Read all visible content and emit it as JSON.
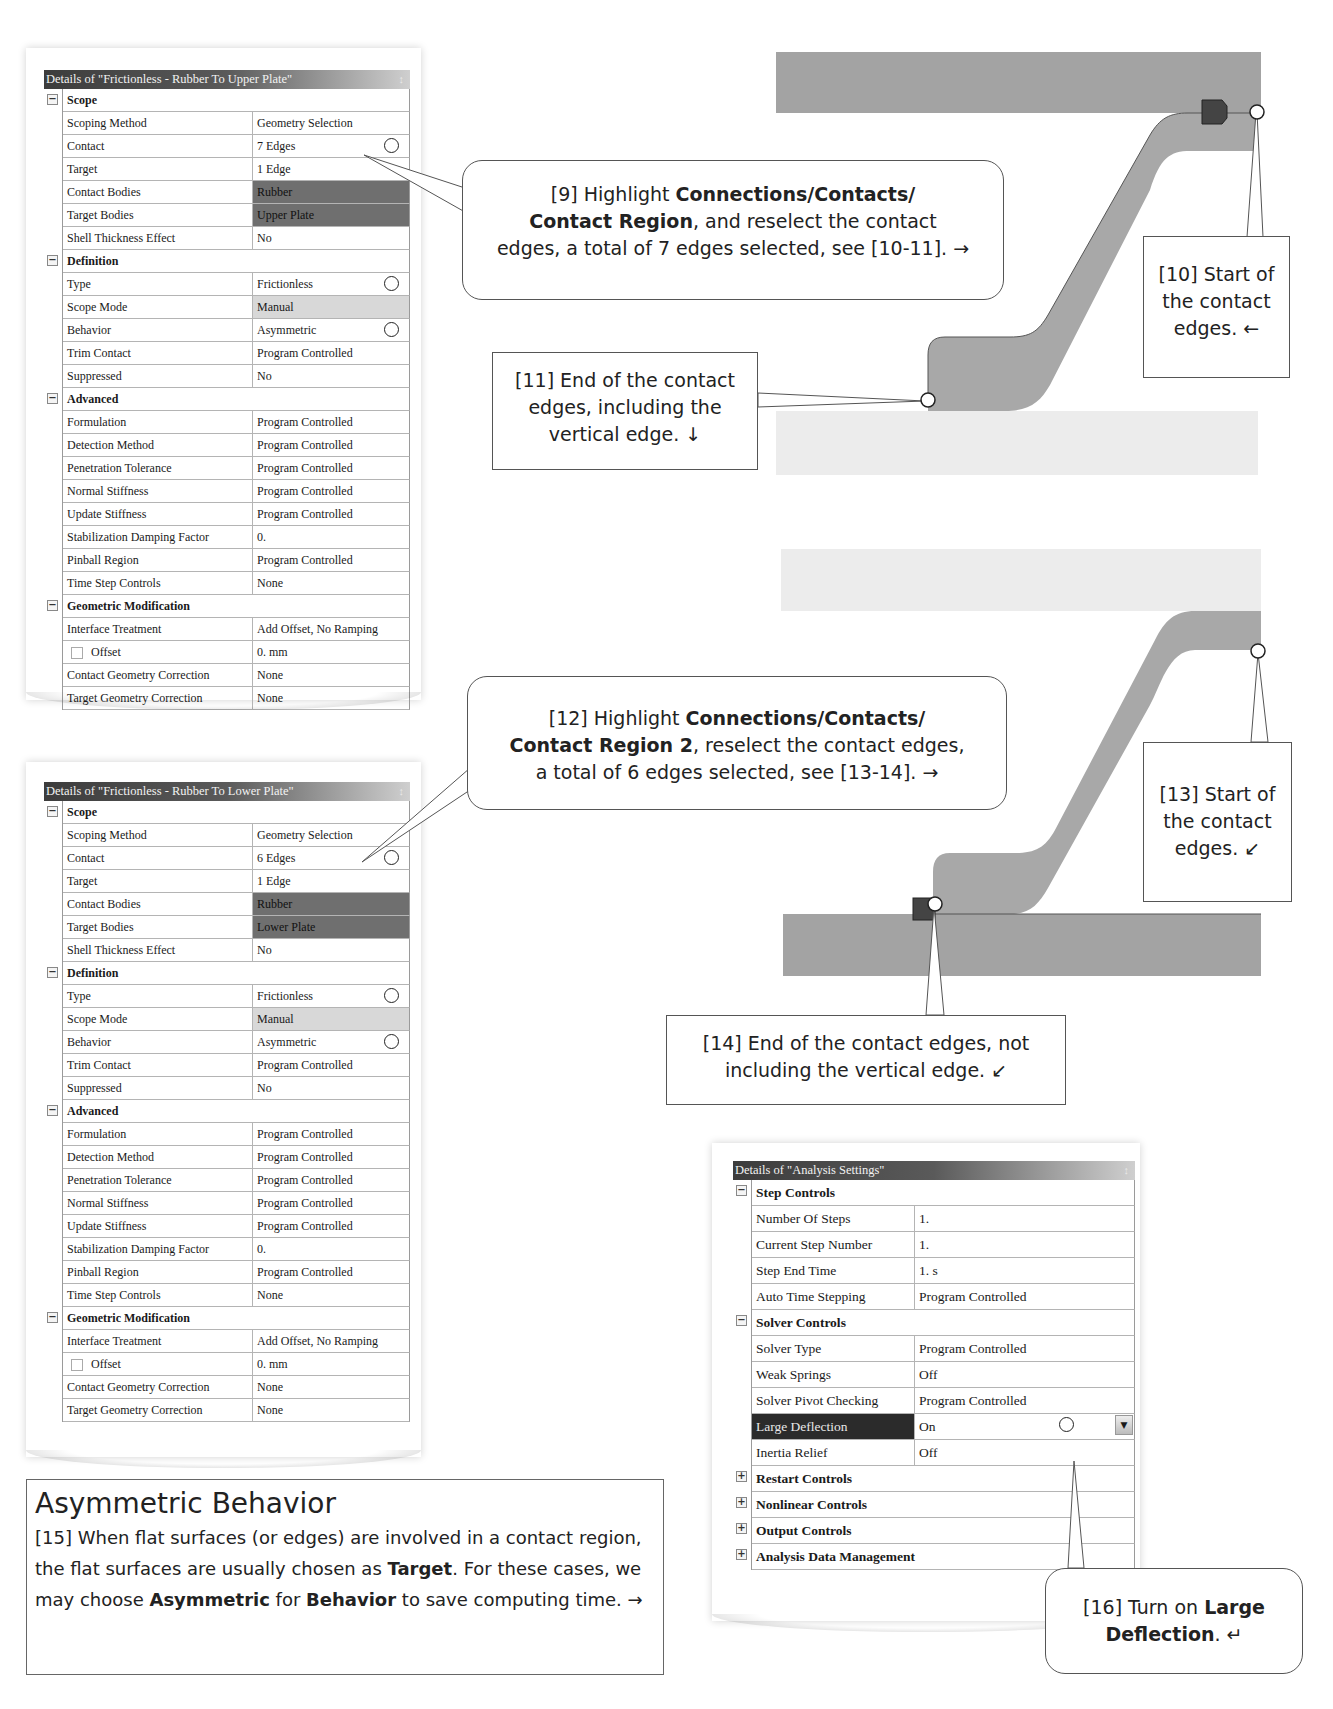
{
  "panel_upper": {
    "title": "Details of \"Frictionless - Rubber To Upper Plate\"",
    "pin_icon": "pin-icon",
    "groups": [
      {
        "label": "Scope",
        "rows": [
          {
            "k": "Scoping Method",
            "v": "Geometry Selection"
          },
          {
            "k": "Contact",
            "v": "7 Edges"
          },
          {
            "k": "Target",
            "v": "1 Edge"
          },
          {
            "k": "Contact Bodies",
            "v": "Rubber"
          },
          {
            "k": "Target Bodies",
            "v": "Upper Plate"
          },
          {
            "k": "Shell Thickness Effect",
            "v": "No"
          }
        ]
      },
      {
        "label": "Definition",
        "rows": [
          {
            "k": "Type",
            "v": "Frictionless"
          },
          {
            "k": "Scope Mode",
            "v": "Manual"
          },
          {
            "k": "Behavior",
            "v": "Asymmetric"
          },
          {
            "k": "Trim Contact",
            "v": "Program Controlled"
          },
          {
            "k": "Suppressed",
            "v": "No"
          }
        ]
      },
      {
        "label": "Advanced",
        "rows": [
          {
            "k": "Formulation",
            "v": "Program Controlled"
          },
          {
            "k": "Detection Method",
            "v": "Program Controlled"
          },
          {
            "k": "Penetration Tolerance",
            "v": "Program Controlled"
          },
          {
            "k": "Normal Stiffness",
            "v": "Program Controlled"
          },
          {
            "k": "Update Stiffness",
            "v": "Program Controlled"
          },
          {
            "k": "Stabilization Damping Factor",
            "v": "0."
          },
          {
            "k": "Pinball Region",
            "v": "Program Controlled"
          },
          {
            "k": "Time Step Controls",
            "v": "None"
          }
        ]
      },
      {
        "label": "Geometric Modification",
        "rows": [
          {
            "k": "Interface Treatment",
            "v": "Add Offset, No Ramping"
          },
          {
            "k": "Offset",
            "v": "0. mm"
          },
          {
            "k": "Contact Geometry Correction",
            "v": "None"
          },
          {
            "k": "Target Geometry Correction",
            "v": "None"
          }
        ]
      }
    ]
  },
  "panel_lower": {
    "title": "Details of \"Frictionless - Rubber To Lower Plate\"",
    "pin_icon": "pin-icon",
    "groups": [
      {
        "label": "Scope",
        "rows": [
          {
            "k": "Scoping Method",
            "v": "Geometry Selection"
          },
          {
            "k": "Contact",
            "v": "6 Edges"
          },
          {
            "k": "Target",
            "v": "1 Edge"
          },
          {
            "k": "Contact Bodies",
            "v": "Rubber"
          },
          {
            "k": "Target Bodies",
            "v": "Lower Plate"
          },
          {
            "k": "Shell Thickness Effect",
            "v": "No"
          }
        ]
      },
      {
        "label": "Definition",
        "rows": [
          {
            "k": "Type",
            "v": "Frictionless"
          },
          {
            "k": "Scope Mode",
            "v": "Manual"
          },
          {
            "k": "Behavior",
            "v": "Asymmetric"
          },
          {
            "k": "Trim Contact",
            "v": "Program Controlled"
          },
          {
            "k": "Suppressed",
            "v": "No"
          }
        ]
      },
      {
        "label": "Advanced",
        "rows": [
          {
            "k": "Formulation",
            "v": "Program Controlled"
          },
          {
            "k": "Detection Method",
            "v": "Program Controlled"
          },
          {
            "k": "Penetration Tolerance",
            "v": "Program Controlled"
          },
          {
            "k": "Normal Stiffness",
            "v": "Program Controlled"
          },
          {
            "k": "Update Stiffness",
            "v": "Program Controlled"
          },
          {
            "k": "Stabilization Damping Factor",
            "v": "0."
          },
          {
            "k": "Pinball Region",
            "v": "Program Controlled"
          },
          {
            "k": "Time Step Controls",
            "v": "None"
          }
        ]
      },
      {
        "label": "Geometric Modification",
        "rows": [
          {
            "k": "Interface Treatment",
            "v": "Add Offset, No Ramping"
          },
          {
            "k": "Offset",
            "v": "0. mm"
          },
          {
            "k": "Contact Geometry Correction",
            "v": "None"
          },
          {
            "k": "Target Geometry Correction",
            "v": "None"
          }
        ]
      }
    ]
  },
  "panel_analysis": {
    "title": "Details of \"Analysis Settings\"",
    "pin_icon": "pin-icon",
    "groups": [
      {
        "label": "Step Controls",
        "expanded": true,
        "rows": [
          {
            "k": "Number Of Steps",
            "v": "1."
          },
          {
            "k": "Current Step Number",
            "v": "1."
          },
          {
            "k": "Step End Time",
            "v": "1. s"
          },
          {
            "k": "Auto Time Stepping",
            "v": "Program Controlled"
          }
        ]
      },
      {
        "label": "Solver Controls",
        "expanded": true,
        "rows": [
          {
            "k": "Solver Type",
            "v": "Program Controlled"
          },
          {
            "k": "Weak Springs",
            "v": "Off"
          },
          {
            "k": "Solver Pivot Checking",
            "v": "Program Controlled"
          },
          {
            "k": "Large Deflection",
            "v": "On"
          },
          {
            "k": "Inertia Relief",
            "v": "Off"
          }
        ]
      },
      {
        "label": "Restart Controls",
        "expanded": false
      },
      {
        "label": "Nonlinear Controls",
        "expanded": false
      },
      {
        "label": "Output Controls",
        "expanded": false
      },
      {
        "label": "Analysis Data Management",
        "expanded": false
      }
    ]
  },
  "callouts": {
    "c9": {
      "pre": "[9] Highlight ",
      "b1": "Connections/Contacts/",
      "b2": "Contact Region",
      "post": ", and reselect the contact",
      "line3": "edges, a total of 7 edges selected, see [10-11]. →"
    },
    "c10": {
      "text": "[10] Start of the contact edges. ←"
    },
    "c11": {
      "text": "[11] End of the contact edges, including the vertical edge. ↓"
    },
    "c12": {
      "pre": "[12] Highlight ",
      "b1": "Connections/Contacts/",
      "b2": "Contact Region 2",
      "post": ", reselect the contact edges,",
      "line3": "a total of 6 edges selected, see [13-14]. →"
    },
    "c13": {
      "text": "[13] Start of the contact edges. ↙"
    },
    "c14": {
      "text": "[14] End of the contact edges, not including the vertical edge. ↙"
    },
    "c16": {
      "pre": "[16] Turn on ",
      "b1": "Large",
      "b2": "Deflection",
      "post": ". ↵"
    }
  },
  "note": {
    "title": "Asymmetric Behavior",
    "p1": "[15] When flat surfaces (or edges) are involved in a contact region, the flat surfaces are usually chosen as ",
    "b1": "Target",
    "p2": ".  For these cases, we may choose ",
    "b2": "Asymmetric",
    "p3": " for ",
    "b3": "Behavior",
    "p4": " to save computing time. →"
  },
  "colors": {
    "plate_dark": "#a3a3a3",
    "plate_light": "#ececec",
    "rubber": "#a8a8a8",
    "marker": "#444444",
    "selected_row": "#2b2b2b"
  }
}
